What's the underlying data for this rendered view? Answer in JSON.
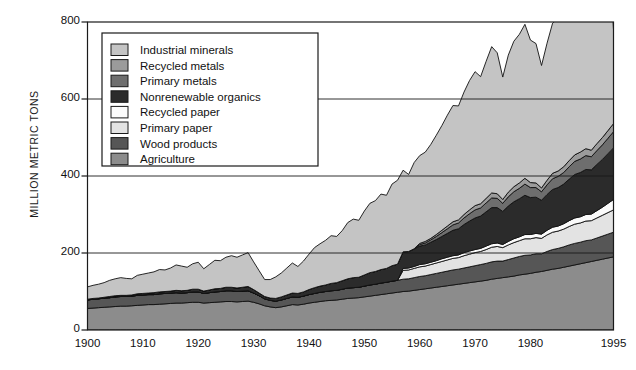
{
  "chart_data": {
    "type": "area",
    "title": "",
    "subtitle": "",
    "xlabel": "",
    "ylabel": "MILLION METRIC TONS",
    "xlim": [
      1900,
      1995
    ],
    "ylim": [
      0,
      800
    ],
    "ytick_labels": [
      "0",
      "200",
      "400",
      "600",
      "800"
    ],
    "yticks": [
      0,
      200,
      400,
      600,
      800
    ],
    "xtick_labels": [
      "1900",
      "1910",
      "1920",
      "1930",
      "1940",
      "1950",
      "1960",
      "1970",
      "1980",
      "1995"
    ],
    "xticks": [
      1900,
      1910,
      1920,
      1930,
      1940,
      1950,
      1960,
      1970,
      1980,
      1995
    ],
    "grid": "horizontal-gridlines-at-200-400-600",
    "legend_position": "upper-left-inside",
    "stack_order_bottom_to_top": [
      "Agriculture",
      "Wood products",
      "Primary paper",
      "Recycled paper",
      "Nonrenewable organics",
      "Primary metals",
      "Recycled metals",
      "Industrial minerals"
    ],
    "x": [
      1900,
      1901,
      1902,
      1903,
      1904,
      1905,
      1906,
      1907,
      1908,
      1909,
      1910,
      1911,
      1912,
      1913,
      1914,
      1915,
      1916,
      1917,
      1918,
      1919,
      1920,
      1921,
      1922,
      1923,
      1924,
      1925,
      1926,
      1927,
      1928,
      1929,
      1930,
      1931,
      1932,
      1933,
      1934,
      1935,
      1936,
      1937,
      1938,
      1939,
      1940,
      1941,
      1942,
      1943,
      1944,
      1945,
      1946,
      1947,
      1948,
      1949,
      1950,
      1951,
      1952,
      1953,
      1954,
      1955,
      1956,
      1957,
      1958,
      1959,
      1960,
      1961,
      1962,
      1963,
      1964,
      1965,
      1966,
      1967,
      1968,
      1969,
      1970,
      1971,
      1972,
      1973,
      1974,
      1975,
      1976,
      1977,
      1978,
      1979,
      1980,
      1981,
      1982,
      1983,
      1984,
      1985,
      1986,
      1987,
      1988,
      1989,
      1990,
      1991,
      1992,
      1993,
      1994,
      1995
    ],
    "series": [
      {
        "name": "Agriculture",
        "color": "#8c8c8c",
        "values": [
          56,
          57,
          58,
          59,
          60,
          61,
          62,
          62,
          63,
          64,
          65,
          66,
          66,
          67,
          68,
          69,
          70,
          70,
          71,
          72,
          72,
          70,
          71,
          72,
          73,
          74,
          74,
          73,
          74,
          75,
          72,
          68,
          63,
          60,
          58,
          60,
          63,
          66,
          65,
          67,
          70,
          72,
          74,
          76,
          77,
          78,
          80,
          82,
          83,
          84,
          86,
          88,
          90,
          92,
          94,
          96,
          98,
          100,
          101,
          103,
          105,
          107,
          109,
          111,
          113,
          115,
          117,
          119,
          121,
          123,
          125,
          127,
          129,
          132,
          134,
          136,
          138,
          140,
          143,
          145,
          147,
          150,
          152,
          155,
          158,
          160,
          163,
          166,
          169,
          172,
          175,
          178,
          181,
          184,
          187,
          190
        ]
      },
      {
        "name": "Wood products",
        "color": "#565656",
        "values": [
          22,
          23,
          23,
          24,
          24,
          25,
          25,
          25,
          25,
          26,
          26,
          26,
          26,
          27,
          27,
          27,
          27,
          26,
          26,
          27,
          27,
          25,
          26,
          27,
          27,
          28,
          28,
          27,
          27,
          27,
          24,
          21,
          18,
          17,
          17,
          18,
          19,
          20,
          20,
          21,
          22,
          23,
          24,
          24,
          25,
          25,
          26,
          27,
          27,
          27,
          28,
          29,
          29,
          30,
          30,
          31,
          31,
          32,
          32,
          33,
          34,
          34,
          35,
          36,
          37,
          38,
          39,
          39,
          40,
          41,
          42,
          43,
          44,
          45,
          45,
          43,
          45,
          47,
          48,
          49,
          48,
          48,
          46,
          49,
          51,
          52,
          53,
          55,
          56,
          56,
          57,
          56,
          58,
          60,
          62,
          64
        ]
      },
      {
        "name": "Primary paper",
        "color": "#e3e3e3",
        "values": [
          0,
          0,
          0,
          0,
          0,
          0,
          0,
          0,
          0,
          0,
          0,
          0,
          0,
          0,
          0,
          0,
          0,
          0,
          0,
          0,
          0,
          0,
          0,
          0,
          0,
          0,
          0,
          0,
          0,
          0,
          0,
          0,
          0,
          0,
          0,
          0,
          0,
          0,
          0,
          0,
          0,
          0,
          0,
          0,
          0,
          0,
          0,
          0,
          0,
          0,
          0,
          0,
          0,
          0,
          0,
          0,
          0,
          23,
          23,
          24,
          25,
          25,
          26,
          27,
          28,
          29,
          30,
          30,
          32,
          33,
          34,
          34,
          36,
          38,
          38,
          35,
          38,
          40,
          41,
          43,
          42,
          42,
          40,
          43,
          45,
          45,
          46,
          48,
          50,
          50,
          51,
          50,
          52,
          54,
          56,
          58
        ]
      },
      {
        "name": "Recycled paper",
        "color": "#fbfbfb",
        "values": [
          0,
          0,
          0,
          0,
          0,
          0,
          0,
          0,
          0,
          0,
          0,
          0,
          0,
          0,
          0,
          0,
          0,
          0,
          0,
          0,
          0,
          0,
          0,
          0,
          0,
          0,
          0,
          0,
          0,
          0,
          0,
          0,
          0,
          0,
          0,
          0,
          0,
          0,
          0,
          0,
          0,
          0,
          0,
          0,
          0,
          0,
          0,
          0,
          0,
          0,
          0,
          0,
          0,
          0,
          0,
          0,
          0,
          5,
          5,
          5,
          6,
          6,
          6,
          6,
          7,
          7,
          7,
          7,
          8,
          8,
          8,
          8,
          9,
          9,
          9,
          8,
          9,
          10,
          10,
          11,
          11,
          11,
          11,
          12,
          13,
          13,
          14,
          15,
          16,
          16,
          17,
          17,
          19,
          21,
          24,
          27
        ]
      },
      {
        "name": "Nonrenewable organics",
        "color": "#2b2b2b",
        "values": [
          2,
          2,
          2,
          2,
          3,
          3,
          3,
          3,
          3,
          4,
          4,
          4,
          5,
          5,
          5,
          5,
          6,
          6,
          6,
          7,
          7,
          6,
          7,
          8,
          8,
          9,
          9,
          9,
          10,
          11,
          9,
          7,
          6,
          6,
          7,
          8,
          9,
          10,
          10,
          11,
          13,
          15,
          16,
          17,
          19,
          20,
          22,
          24,
          26,
          26,
          29,
          32,
          33,
          35,
          36,
          40,
          42,
          43,
          43,
          46,
          48,
          49,
          52,
          55,
          58,
          62,
          66,
          68,
          73,
          78,
          82,
          84,
          89,
          94,
          92,
          86,
          92,
          96,
          99,
          102,
          96,
          94,
          88,
          93,
          98,
          100,
          103,
          108,
          113,
          115,
          117,
          115,
          120,
          124,
          129,
          134
        ]
      },
      {
        "name": "Primary metals",
        "color": "#6e6e6e",
        "values": [
          0,
          0,
          0,
          0,
          0,
          0,
          0,
          0,
          0,
          0,
          0,
          0,
          0,
          0,
          0,
          0,
          0,
          0,
          0,
          0,
          0,
          0,
          0,
          0,
          0,
          0,
          0,
          0,
          0,
          0,
          0,
          0,
          0,
          0,
          0,
          0,
          0,
          0,
          0,
          0,
          0,
          0,
          0,
          0,
          0,
          0,
          0,
          0,
          0,
          0,
          0,
          0,
          0,
          0,
          0,
          0,
          0,
          0,
          0,
          0,
          4,
          5,
          6,
          8,
          10,
          12,
          14,
          15,
          17,
          19,
          21,
          21,
          23,
          25,
          24,
          21,
          24,
          26,
          27,
          29,
          26,
          25,
          22,
          25,
          28,
          29,
          30,
          32,
          34,
          35,
          36,
          34,
          36,
          38,
          40,
          42
        ]
      },
      {
        "name": "Recycled metals",
        "color": "#9b9b9b",
        "values": [
          0,
          0,
          0,
          0,
          0,
          0,
          0,
          0,
          0,
          0,
          0,
          0,
          0,
          0,
          0,
          0,
          0,
          0,
          0,
          0,
          0,
          0,
          0,
          0,
          0,
          0,
          0,
          0,
          0,
          0,
          0,
          0,
          0,
          0,
          0,
          0,
          0,
          0,
          0,
          0,
          0,
          0,
          0,
          0,
          0,
          0,
          0,
          0,
          0,
          0,
          0,
          0,
          0,
          0,
          0,
          0,
          0,
          0,
          0,
          0,
          3,
          4,
          4,
          5,
          6,
          7,
          8,
          8,
          9,
          10,
          11,
          11,
          12,
          13,
          12,
          10,
          12,
          13,
          14,
          15,
          13,
          12,
          10,
          12,
          14,
          14,
          15,
          16,
          17,
          18,
          18,
          17,
          18,
          19,
          20,
          21
        ]
      },
      {
        "name": "Industrial minerals",
        "color": "#c4c4c4",
        "values": [
          32,
          34,
          36,
          38,
          42,
          44,
          46,
          44,
          42,
          48,
          50,
          52,
          54,
          58,
          56,
          60,
          66,
          64,
          60,
          66,
          70,
          58,
          66,
          74,
          72,
          78,
          82,
          80,
          84,
          88,
          72,
          58,
          44,
          48,
          56,
          62,
          70,
          78,
          70,
          80,
          92,
          104,
          110,
          116,
          124,
          120,
          130,
          146,
          152,
          148,
          166,
          180,
          184,
          196,
          190,
          212,
          218,
          212,
          200,
          224,
          228,
          232,
          244,
          258,
          272,
          288,
          302,
          296,
          318,
          336,
          348,
          330,
          356,
          380,
          366,
          318,
          356,
          378,
          386,
          400,
          370,
          362,
          318,
          356,
          390,
          396,
          408,
          428,
          448,
          454,
          458,
          440,
          466,
          490,
          516,
          244
        ]
      }
    ]
  },
  "legend": {
    "items": [
      {
        "label": "Industrial minerals",
        "color": "#c4c4c4"
      },
      {
        "label": "Recycled metals",
        "color": "#9b9b9b"
      },
      {
        "label": "Primary metals",
        "color": "#6e6e6e"
      },
      {
        "label": "Nonrenewable organics",
        "color": "#2b2b2b"
      },
      {
        "label": "Recycled paper",
        "color": "#fbfbfb"
      },
      {
        "label": "Primary paper",
        "color": "#e3e3e3"
      },
      {
        "label": "Wood products",
        "color": "#565656"
      },
      {
        "label": "Agriculture",
        "color": "#8c8c8c"
      }
    ]
  }
}
